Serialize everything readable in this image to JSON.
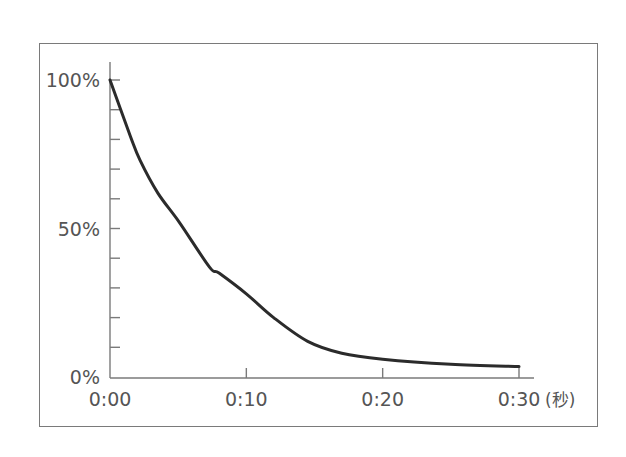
{
  "chart_data": {
    "type": "line",
    "title": "",
    "xlabel": "",
    "ylabel": "",
    "x_unit": "(秒)",
    "x_tick_labels": [
      "0:00",
      "0:10",
      "0:20",
      "0:30"
    ],
    "x_tick_values": [
      0,
      10,
      20,
      30
    ],
    "y_tick_labels": [
      "100%",
      "50%",
      "0%"
    ],
    "y_tick_values": [
      100,
      50,
      0
    ],
    "y_minor_ticks_every": 10,
    "xlim": [
      0,
      30
    ],
    "ylim": [
      0,
      100
    ],
    "grid": false,
    "legend": null,
    "series": [
      {
        "name": "decay",
        "x": [
          0,
          1.5,
          2.2,
          3.5,
          5.1,
          7.3,
          8,
          10,
          12,
          14.5,
          17,
          20,
          25,
          30
        ],
        "values": [
          100,
          81,
          73,
          62,
          52,
          37,
          35,
          28,
          20,
          12,
          8,
          6,
          4.3,
          3.5
        ],
        "color": "#2b2b2b"
      }
    ]
  },
  "colors": {
    "curve": "#2b2b2b",
    "axis": "#7a7a7a",
    "frame": "#7a7a7a",
    "text": "#555555"
  }
}
